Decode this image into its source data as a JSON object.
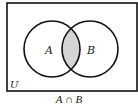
{
  "diagram": {
    "type": "venn",
    "universe_label": "U",
    "sets": [
      {
        "label": "A",
        "cx": 52,
        "cy": 49,
        "r": 28
      },
      {
        "label": "B",
        "cx": 90,
        "cy": 49,
        "r": 28
      }
    ],
    "shaded_region": "A ∩ B",
    "shade_color": "#d4d4d4",
    "stroke_color": "#111111",
    "caption": "A ∩ B"
  }
}
